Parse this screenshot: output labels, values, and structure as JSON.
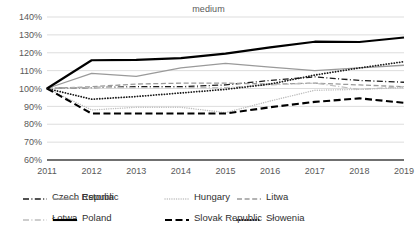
{
  "chart_data": {
    "type": "line",
    "title": "medium",
    "xlabel": "",
    "ylabel": "",
    "x": [
      2011,
      2012,
      2013,
      2014,
      2015,
      2016,
      2017,
      2018,
      2019
    ],
    "xtick_labels": [
      "2011",
      "2012",
      "2013",
      "2014",
      "2015",
      "2016",
      "2017",
      "2018",
      "2019"
    ],
    "ytick_labels": [
      "60%",
      "70%",
      "80%",
      "90%",
      "100%",
      "110%",
      "120%",
      "130%",
      "140%"
    ],
    "ytick_values": [
      60,
      70,
      80,
      90,
      100,
      110,
      120,
      130,
      140
    ],
    "ylim": [
      60,
      140
    ],
    "grid": true,
    "grid_axis": "y",
    "legend_position": "bottom",
    "series": [
      {
        "name": "Czech Republic",
        "style": "dash-dot",
        "color": "#1a1a1a",
        "width": 1.3,
        "values": [
          100,
          100.5,
          101,
          101,
          102,
          104.5,
          106.5,
          104.5,
          103.5
        ]
      },
      {
        "name": "Estonia",
        "style": "solid",
        "color": "#9a9a9a",
        "width": 1.3,
        "values": [
          100,
          108.5,
          106.8,
          111.5,
          114,
          112,
          110,
          111.5,
          113
        ]
      },
      {
        "name": "Hungary",
        "style": "dotted",
        "color": "#bdbdbd",
        "width": 1.4,
        "values": [
          100,
          88,
          89.5,
          89.5,
          86.5,
          93,
          99,
          99.5,
          100.5
        ]
      },
      {
        "name": "Litwa",
        "style": "dashed",
        "color": "#9a9a9a",
        "width": 1.3,
        "values": [
          100,
          101,
          102.5,
          103,
          103,
          102.5,
          103,
          102,
          101
        ]
      },
      {
        "name": "Łotwa",
        "style": "dash-dot",
        "color": "#bdbdbd",
        "width": 1.2,
        "values": [
          100,
          100.5,
          100.5,
          100.5,
          100.5,
          102,
          103,
          99.5,
          101
        ]
      },
      {
        "name": "Poland",
        "style": "solid",
        "color": "#000000",
        "width": 2.1,
        "values": [
          100,
          115.8,
          116,
          117,
          119.5,
          123,
          126.2,
          126,
          128.5
        ]
      },
      {
        "name": "Slovak Republic",
        "style": "dashed",
        "color": "#000000",
        "width": 2.1,
        "values": [
          100,
          86,
          86,
          86,
          86,
          89.5,
          92.5,
          94.5,
          92
        ]
      },
      {
        "name": "Słowenia",
        "style": "dotted",
        "color": "#1a1a1a",
        "width": 1.8,
        "values": [
          100,
          94,
          95.5,
          97.5,
          99.5,
          102.5,
          107.5,
          111.5,
          115
        ]
      }
    ]
  },
  "legend": {
    "rows": [
      [
        "Czech Republic",
        "Estonia",
        "Hungary",
        "Litwa"
      ],
      [
        "Łotwa",
        "Poland",
        "Slovak Republic",
        "Słowenia"
      ]
    ]
  }
}
